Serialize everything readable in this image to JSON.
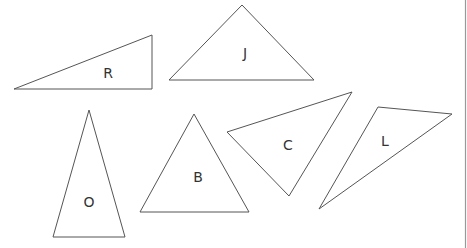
{
  "diagram": {
    "stroke_color": "#555555",
    "background": "#ffffff",
    "triangles": [
      {
        "label": "R",
        "points": "14,89 152,35 152,89",
        "label_x": 108,
        "label_y": 74
      },
      {
        "label": "J",
        "points": "169,80 242,5 314,80",
        "label_x": 245,
        "label_y": 54
      },
      {
        "label": "O",
        "points": "89,110 53,237 125,237",
        "label_x": 89,
        "label_y": 203
      },
      {
        "label": "B",
        "points": "194,114 140,212 249,212",
        "label_x": 198,
        "label_y": 178
      },
      {
        "label": "C",
        "points": "227,132 352,92 289,196",
        "label_x": 288,
        "label_y": 146
      },
      {
        "label": "L",
        "points": "378,107 452,114 319,209",
        "label_x": 385,
        "label_y": 142
      }
    ]
  }
}
